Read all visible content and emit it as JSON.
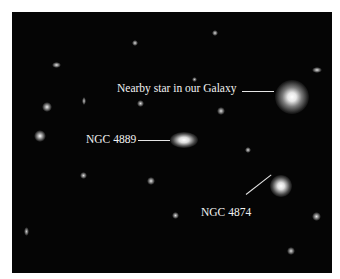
{
  "image": {
    "subject": "galaxy cluster field (deep sky astronomical image)",
    "background_color": "#050505"
  },
  "annotations": [
    {
      "id": "nearby-star",
      "text": "Nearby star in our Galaxy"
    },
    {
      "id": "ngc-4889",
      "text": "NGC 4889"
    },
    {
      "id": "ngc-4874",
      "text": "NGC 4874"
    }
  ]
}
